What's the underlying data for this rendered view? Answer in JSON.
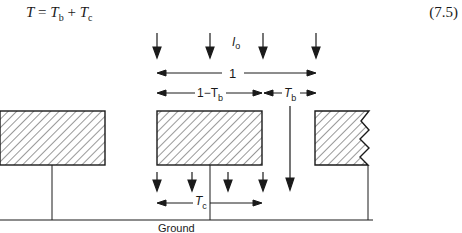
{
  "equation": {
    "lhs": "T",
    "equals": " = ",
    "term1": "T",
    "term1_sub": "b",
    "plus": " + ",
    "term2": "T",
    "term2_sub": "c",
    "number": "(7.5)"
  },
  "figure": {
    "incident_label": "I",
    "incident_sub": "o",
    "full_width_label": "1",
    "gap_label": "1−T",
    "gap_sub": "b",
    "tb_label": "T",
    "tb_sub": "b",
    "tc_label": "T",
    "tc_sub": "c",
    "ground_label": "Ground"
  }
}
